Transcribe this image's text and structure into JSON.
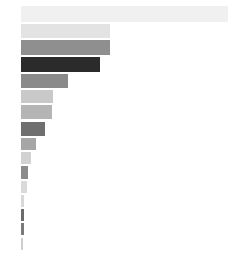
{
  "chart_data": {
    "type": "bar",
    "orientation": "horizontal",
    "title": "",
    "subtitle": "",
    "xlabel": "",
    "ylabel": "",
    "grid": false,
    "legend": false,
    "axes_visible": false,
    "tick_labels": false,
    "background_color": "#ffffff",
    "plot_left_px": 21,
    "plot_width_px": 207,
    "xlim": [
      0,
      207
    ],
    "categories": [
      "1",
      "2",
      "3",
      "4",
      "5",
      "6",
      "7",
      "8",
      "9",
      "10",
      "11",
      "12",
      "13",
      "14",
      "15",
      "16"
    ],
    "values": [
      207,
      89,
      89,
      79,
      47,
      32,
      31,
      24,
      15,
      10,
      7,
      6,
      3,
      3,
      3,
      2
    ],
    "bar_colors": [
      "#f0f0f0",
      "#e3e3e3",
      "#8f8f8f",
      "#2b2b2b",
      "#8a8a8a",
      "#c9c9c9",
      "#b5b5b5",
      "#6f6f6f",
      "#a6a6a6",
      "#d2d2d2",
      "#8b8b8b",
      "#dadada",
      "#d8d8d8",
      "#6b6b6b",
      "#7a7a7a",
      "#cfcfcf"
    ],
    "bar_tops_px": [
      6,
      24,
      40,
      57,
      74,
      90,
      105,
      122,
      138,
      152,
      166,
      181,
      195,
      209,
      223,
      238
    ],
    "bar_heights_px": [
      16,
      14,
      15,
      15,
      14,
      13,
      14,
      14,
      12,
      12,
      13,
      12,
      12,
      12,
      12,
      12
    ]
  }
}
